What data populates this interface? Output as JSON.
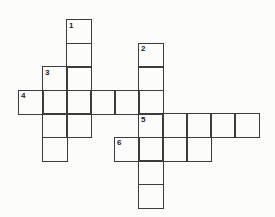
{
  "puzzle": {
    "type": "crossword-grid",
    "numbers_visible": [
      "1",
      "2",
      "3",
      "4",
      "5",
      "6"
    ],
    "colors": {
      "background": "#fcfcfb",
      "line": "#3c3c3c",
      "number": "#1c1c1c"
    },
    "grid": {
      "rows": 8,
      "cols": 10,
      "origin_x": 18,
      "origin_y": 19,
      "cell_width": 24,
      "cell_height": 23.5,
      "line_width": 1.5
    },
    "cells": [
      {
        "r": 0,
        "c": 2,
        "n": "1"
      },
      {
        "r": 1,
        "c": 2
      },
      {
        "r": 1,
        "c": 5,
        "n": "2"
      },
      {
        "r": 2,
        "c": 1,
        "n": "3"
      },
      {
        "r": 2,
        "c": 2
      },
      {
        "r": 2,
        "c": 5
      },
      {
        "r": 3,
        "c": 0,
        "n": "4"
      },
      {
        "r": 3,
        "c": 1
      },
      {
        "r": 3,
        "c": 2
      },
      {
        "r": 3,
        "c": 3
      },
      {
        "r": 3,
        "c": 4
      },
      {
        "r": 3,
        "c": 5
      },
      {
        "r": 4,
        "c": 1
      },
      {
        "r": 4,
        "c": 2
      },
      {
        "r": 4,
        "c": 5,
        "n": "5"
      },
      {
        "r": 4,
        "c": 6
      },
      {
        "r": 4,
        "c": 7
      },
      {
        "r": 4,
        "c": 8
      },
      {
        "r": 4,
        "c": 9
      },
      {
        "r": 5,
        "c": 1
      },
      {
        "r": 5,
        "c": 4,
        "n": "6"
      },
      {
        "r": 5,
        "c": 5
      },
      {
        "r": 5,
        "c": 6
      },
      {
        "r": 5,
        "c": 7
      },
      {
        "r": 6,
        "c": 5
      },
      {
        "r": 7,
        "c": 5
      }
    ],
    "words": [
      {
        "number": "1",
        "direction": "down",
        "start_row": 0,
        "start_col": 2,
        "length": 5
      },
      {
        "number": "2",
        "direction": "down",
        "start_row": 1,
        "start_col": 5,
        "length": 7
      },
      {
        "number": "3",
        "direction": "down",
        "start_row": 2,
        "start_col": 1,
        "length": 4
      },
      {
        "number": "4",
        "direction": "across",
        "start_row": 3,
        "start_col": 0,
        "length": 6
      },
      {
        "number": "5",
        "direction": "across",
        "start_row": 4,
        "start_col": 5,
        "length": 5
      },
      {
        "number": "6",
        "direction": "across",
        "start_row": 5,
        "start_col": 4,
        "length": 4
      }
    ]
  }
}
